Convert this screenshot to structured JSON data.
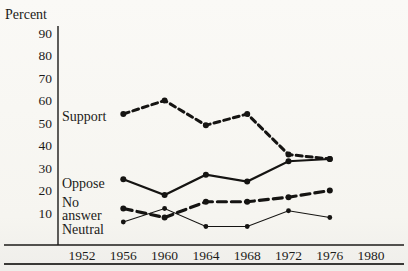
{
  "page": {
    "background": "#f7f6f2",
    "ink_color": "#1c1b19"
  },
  "chart_data": {
    "type": "line",
    "title": "",
    "ylabel": "Percent",
    "xlabel": "",
    "grid": false,
    "legend_position": "inline-left-of-lines",
    "xlim": [
      1952,
      1980
    ],
    "ylim": [
      0,
      95
    ],
    "x_ticks": [
      "1952",
      "1956",
      "1960",
      "1964",
      "1968",
      "1972",
      "1976",
      "1980"
    ],
    "y_ticks": [
      "90",
      "80",
      "70",
      "60",
      "50",
      "40",
      "30",
      "20",
      "10"
    ],
    "x": [
      1956,
      1960,
      1964,
      1968,
      1972,
      1976
    ],
    "series": [
      {
        "name": "support",
        "label": "Support",
        "label_lines": [
          "Support"
        ],
        "style": "dashed-short-thick",
        "marker": "dot",
        "values": [
          54,
          60,
          49,
          54,
          36,
          34
        ]
      },
      {
        "name": "oppose",
        "label": "Oppose",
        "label_lines": [
          "Oppose"
        ],
        "style": "solid-thick",
        "marker": "dot",
        "values": [
          25,
          18,
          27,
          24,
          33,
          34
        ]
      },
      {
        "name": "no_answer",
        "label": "No answer",
        "label_lines": [
          "No",
          "answer"
        ],
        "style": "dashed-long-thick",
        "marker": "dot",
        "values": [
          12,
          8,
          15,
          15,
          17,
          20
        ]
      },
      {
        "name": "neutral",
        "label": "Neutral",
        "label_lines": [
          "Neutral"
        ],
        "style": "solid-thin",
        "marker": "dot",
        "values": [
          6,
          12,
          4,
          4,
          11,
          8
        ]
      }
    ],
    "line_color": "#151412"
  }
}
